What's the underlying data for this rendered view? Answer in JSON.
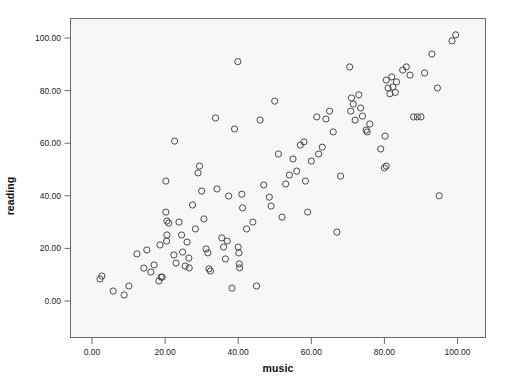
{
  "chart_data": {
    "type": "scatter",
    "title": "",
    "xlabel": "music",
    "ylabel": "reading",
    "xlim": [
      -4,
      108
    ],
    "ylim": [
      -6,
      108
    ],
    "grid": false,
    "legend": null,
    "marker": {
      "shape": "circle-open",
      "edge_color": "#4a4a52",
      "fill": "none",
      "radius_px": 3.1,
      "line_width": 1
    },
    "xticks": [
      0,
      20,
      40,
      60,
      80,
      100
    ],
    "yticks": [
      0,
      20,
      40,
      60,
      80,
      100
    ],
    "xtick_labels": [
      "0.00",
      "20.00",
      "40.00",
      "60.00",
      "80.00",
      "100.00"
    ],
    "ytick_labels": [
      "0.00",
      "20.00",
      "40.00",
      "60.00",
      "80.00",
      "100.00"
    ],
    "n_points": 108,
    "points": [
      [
        2.2,
        8.4
      ],
      [
        2.7,
        9.5
      ],
      [
        5.8,
        3.8
      ],
      [
        10.1,
        5.7
      ],
      [
        12.3,
        17.9
      ],
      [
        15.0,
        19.4
      ],
      [
        8.8,
        2.3
      ],
      [
        14.2,
        12.5
      ],
      [
        16.1,
        11.0
      ],
      [
        17.0,
        13.7
      ],
      [
        18.3,
        7.6
      ],
      [
        18.6,
        21.3
      ],
      [
        18.9,
        9.1
      ],
      [
        19.2,
        9.1
      ],
      [
        20.2,
        45.6
      ],
      [
        20.2,
        33.8
      ],
      [
        20.4,
        22.8
      ],
      [
        20.5,
        25.1
      ],
      [
        20.5,
        30.4
      ],
      [
        21.0,
        29.6
      ],
      [
        22.6,
        60.8
      ],
      [
        22.4,
        17.5
      ],
      [
        23.0,
        14.4
      ],
      [
        23.8,
        30.0
      ],
      [
        24.5,
        25.1
      ],
      [
        24.8,
        18.6
      ],
      [
        25.5,
        13.3
      ],
      [
        26.0,
        22.4
      ],
      [
        26.5,
        16.3
      ],
      [
        26.6,
        12.6
      ],
      [
        27.5,
        36.5
      ],
      [
        28.3,
        27.4
      ],
      [
        29.0,
        48.7
      ],
      [
        29.4,
        51.3
      ],
      [
        30.0,
        41.8
      ],
      [
        30.6,
        31.2
      ],
      [
        31.2,
        19.8
      ],
      [
        31.7,
        18.3
      ],
      [
        32.0,
        12.2
      ],
      [
        32.4,
        11.4
      ],
      [
        33.8,
        69.6
      ],
      [
        34.2,
        42.6
      ],
      [
        35.5,
        24.0
      ],
      [
        36.0,
        20.5
      ],
      [
        36.5,
        16.0
      ],
      [
        37.0,
        22.8
      ],
      [
        37.4,
        39.9
      ],
      [
        38.3,
        4.9
      ],
      [
        39.0,
        65.4
      ],
      [
        39.9,
        91.0
      ],
      [
        40.0,
        20.5
      ],
      [
        40.2,
        18.3
      ],
      [
        40.3,
        14.1
      ],
      [
        40.4,
        12.6
      ],
      [
        41.0,
        40.6
      ],
      [
        41.2,
        35.4
      ],
      [
        42.3,
        27.4
      ],
      [
        44.0,
        30.0
      ],
      [
        45.0,
        5.7
      ],
      [
        46.0,
        68.8
      ],
      [
        47.0,
        44.1
      ],
      [
        48.5,
        39.5
      ],
      [
        49.0,
        36.1
      ],
      [
        50.0,
        76.0
      ],
      [
        51.0,
        55.9
      ],
      [
        52.0,
        31.9
      ],
      [
        53.0,
        44.5
      ],
      [
        54.0,
        47.9
      ],
      [
        55.0,
        54.0
      ],
      [
        56.0,
        49.4
      ],
      [
        57.0,
        59.3
      ],
      [
        58.0,
        60.5
      ],
      [
        58.4,
        45.6
      ],
      [
        59.0,
        33.8
      ],
      [
        60.0,
        53.2
      ],
      [
        61.5,
        70.0
      ],
      [
        62.0,
        55.9
      ],
      [
        63.0,
        58.5
      ],
      [
        64.0,
        69.2
      ],
      [
        65.0,
        72.2
      ],
      [
        66.0,
        64.3
      ],
      [
        67.0,
        26.2
      ],
      [
        68.0,
        47.5
      ],
      [
        70.5,
        89.0
      ],
      [
        70.8,
        72.2
      ],
      [
        71.0,
        77.2
      ],
      [
        71.5,
        74.9
      ],
      [
        72.0,
        68.8
      ],
      [
        73.0,
        78.4
      ],
      [
        73.5,
        73.4
      ],
      [
        74.0,
        70.3
      ],
      [
        75.0,
        65.0
      ],
      [
        75.3,
        64.3
      ],
      [
        76.0,
        67.3
      ],
      [
        79.0,
        57.8
      ],
      [
        80.0,
        50.6
      ],
      [
        80.5,
        51.3
      ],
      [
        80.2,
        62.7
      ],
      [
        80.5,
        84.0
      ],
      [
        81.0,
        81.0
      ],
      [
        81.5,
        78.8
      ],
      [
        82.0,
        85.2
      ],
      [
        82.3,
        81.4
      ],
      [
        83.0,
        79.3
      ],
      [
        83.3,
        83.3
      ],
      [
        85.0,
        87.8
      ],
      [
        86.0,
        89.0
      ],
      [
        87.0,
        85.9
      ],
      [
        88.0,
        70.0
      ],
      [
        89.0,
        70.0
      ],
      [
        90.0,
        70.0
      ],
      [
        91.0,
        86.7
      ],
      [
        93.0,
        93.9
      ],
      [
        94.5,
        81.0
      ],
      [
        95.0,
        40.0
      ],
      [
        98.5,
        98.9
      ],
      [
        99.5,
        101.2
      ]
    ]
  }
}
